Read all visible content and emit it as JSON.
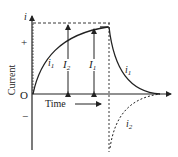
{
  "diagram": {
    "axes": {
      "y_label": "Current",
      "y_axis_symbol": "i",
      "origin_label": "O",
      "positive_label": "+",
      "negative_label": "−",
      "x_label": "Time"
    },
    "curves": [
      {
        "name": "i1 growth",
        "label": "i",
        "sub": "1"
      },
      {
        "name": "i1 decay",
        "label": "i",
        "sub": "1"
      },
      {
        "name": "i2 induced",
        "label": "i",
        "sub": "2",
        "style": "dashed"
      }
    ],
    "markers": [
      {
        "name": "I2 level",
        "label": "I",
        "sub": "2"
      },
      {
        "name": "I1 level",
        "label": "I",
        "sub": "1"
      }
    ],
    "colors": {
      "line": "#222222",
      "background": "#ffffff"
    }
  }
}
